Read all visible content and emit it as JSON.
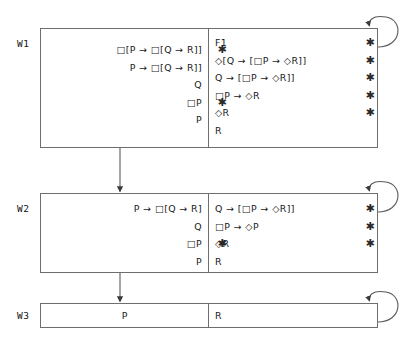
{
  "diagram": {
    "type": "modal-logic-tableau-worlds",
    "worlds": [
      {
        "id": "w1",
        "label": "W1",
        "left_column": [
          {
            "text": "□[P → □[Q → R]]",
            "marked": true
          },
          {
            "text": "P → □[Q → R]]",
            "marked": false
          },
          {
            "text": "Q",
            "marked": false
          },
          {
            "text": "□P",
            "marked": true
          },
          {
            "text": "P",
            "marked": false
          }
        ],
        "right_column": [
          {
            "text": "F1",
            "marked": true
          },
          {
            "text": "◇[Q → [□P → ◇R]]",
            "marked": true
          },
          {
            "text": "Q → [□P → ◇R]]",
            "marked": true
          },
          {
            "text": "□P → ◇R",
            "marked": true
          },
          {
            "text": "◇R",
            "marked": true
          },
          {
            "text": "R",
            "marked": false
          }
        ]
      },
      {
        "id": "w2",
        "label": "W2",
        "left_column": [
          {
            "text": "P → □[Q → R]",
            "marked": false
          },
          {
            "text": "Q",
            "marked": false
          },
          {
            "text": "□P",
            "marked": true
          },
          {
            "text": "P",
            "marked": false
          }
        ],
        "right_column": [
          {
            "text": "Q → [□P → ◇R]]",
            "marked": true
          },
          {
            "text": "□P → ◇P",
            "marked": true
          },
          {
            "text": "◇R",
            "marked": true
          },
          {
            "text": "R",
            "marked": false
          }
        ]
      },
      {
        "id": "w3",
        "label": "W3",
        "left_column": [
          {
            "text": "P",
            "marked": false
          }
        ],
        "right_column": [
          {
            "text": "R",
            "marked": false
          }
        ]
      }
    ],
    "marker_symbol": "✱",
    "transitions": [
      {
        "from": "w1",
        "to": "w2",
        "kind": "vertical-arrow"
      },
      {
        "from": "w2",
        "to": "w3",
        "kind": "vertical-arrow"
      },
      {
        "from": "w1",
        "to": "w1",
        "kind": "self-loop"
      },
      {
        "from": "w2",
        "to": "w2",
        "kind": "self-loop"
      },
      {
        "from": "w3",
        "to": "w3",
        "kind": "self-loop"
      }
    ],
    "colors": {
      "stroke": "#6e6e6e",
      "text": "#1a1a1a",
      "background": "#ffffff",
      "marker": "#2a2a2a"
    }
  }
}
